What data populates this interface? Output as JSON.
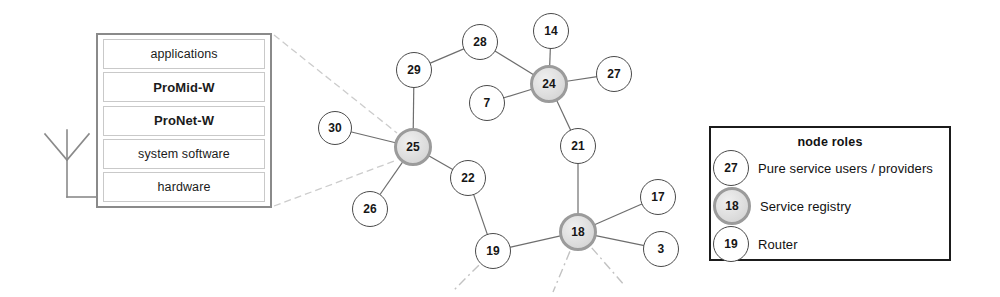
{
  "antenna": {
    "icon_name": "antenna-icon"
  },
  "stack": {
    "layers": [
      {
        "label": "applications",
        "bold": false
      },
      {
        "label": "ProMid-W",
        "bold": true
      },
      {
        "label": "ProNet-W",
        "bold": true
      },
      {
        "label": "system software",
        "bold": false
      },
      {
        "label": "hardware",
        "bold": false
      }
    ]
  },
  "legend": {
    "title": "node roles",
    "items": [
      {
        "node_id": "27",
        "style": "plain",
        "label": "Pure service users / providers"
      },
      {
        "node_id": "18",
        "style": "registry",
        "label": "Service registry"
      },
      {
        "node_id": "19",
        "style": "plain",
        "label": "Router"
      }
    ]
  },
  "graph": {
    "nodes": [
      {
        "id": "30",
        "label": "30",
        "x": 335,
        "y": 128,
        "r": 17,
        "style": "plain"
      },
      {
        "id": "29",
        "label": "29",
        "x": 414,
        "y": 70,
        "r": 18,
        "style": "plain"
      },
      {
        "id": "28",
        "label": "28",
        "x": 480,
        "y": 42,
        "r": 18,
        "style": "plain"
      },
      {
        "id": "14",
        "label": "14",
        "x": 551,
        "y": 31,
        "r": 18,
        "style": "plain"
      },
      {
        "id": "7",
        "label": "7",
        "x": 487,
        "y": 103,
        "r": 18,
        "style": "plain"
      },
      {
        "id": "27",
        "label": "27",
        "x": 614,
        "y": 74,
        "r": 18,
        "style": "plain"
      },
      {
        "id": "24",
        "label": "24",
        "x": 549,
        "y": 84,
        "r": 19,
        "style": "registry"
      },
      {
        "id": "25",
        "label": "25",
        "x": 413,
        "y": 147,
        "r": 19,
        "style": "registry"
      },
      {
        "id": "26",
        "label": "26",
        "x": 370,
        "y": 209,
        "r": 18,
        "style": "plain"
      },
      {
        "id": "22",
        "label": "22",
        "x": 468,
        "y": 178,
        "r": 18,
        "style": "plain"
      },
      {
        "id": "21",
        "label": "21",
        "x": 578,
        "y": 146,
        "r": 18,
        "style": "plain"
      },
      {
        "id": "19",
        "label": "19",
        "x": 493,
        "y": 251,
        "r": 18,
        "style": "plain"
      },
      {
        "id": "18",
        "label": "18",
        "x": 578,
        "y": 232,
        "r": 19,
        "style": "registry"
      },
      {
        "id": "17",
        "label": "17",
        "x": 658,
        "y": 197,
        "r": 18,
        "style": "plain"
      },
      {
        "id": "3",
        "label": "3",
        "x": 661,
        "y": 249,
        "r": 18,
        "style": "plain"
      }
    ],
    "edges": [
      {
        "from": "30",
        "to": "25"
      },
      {
        "from": "29",
        "to": "25"
      },
      {
        "from": "29",
        "to": "28"
      },
      {
        "from": "28",
        "to": "24"
      },
      {
        "from": "14",
        "to": "24"
      },
      {
        "from": "7",
        "to": "24"
      },
      {
        "from": "27",
        "to": "24"
      },
      {
        "from": "24",
        "to": "21"
      },
      {
        "from": "21",
        "to": "18"
      },
      {
        "from": "25",
        "to": "26"
      },
      {
        "from": "25",
        "to": "22"
      },
      {
        "from": "22",
        "to": "19"
      },
      {
        "from": "19",
        "to": "18"
      },
      {
        "from": "18",
        "to": "17"
      },
      {
        "from": "18",
        "to": "3"
      }
    ],
    "trailing_edges": [
      {
        "from": "19",
        "x2": 452,
        "y2": 292
      },
      {
        "from": "18",
        "x2": 553,
        "y2": 292
      },
      {
        "from": "18",
        "x2": 625,
        "y2": 286
      }
    ],
    "callout_lines": [
      {
        "x1": 274,
        "y1": 35,
        "x2": 397,
        "y2": 133
      },
      {
        "x1": 274,
        "y1": 206,
        "x2": 397,
        "y2": 160
      }
    ]
  },
  "colors": {
    "stack_border": "#8a8a8a",
    "stack_layer_border": "#c9c9c9",
    "legend_border": "#1b1b1b",
    "node_plain_border": "#4a4a4a",
    "node_registry_border": "#9b9b9b",
    "node_registry_fill": "#dedede",
    "edge": "#6e6e6e",
    "trailing_edge": "#c2c2c2",
    "callout": "#cccccc",
    "antenna": "#8a8a8a",
    "text": "#161616"
  }
}
